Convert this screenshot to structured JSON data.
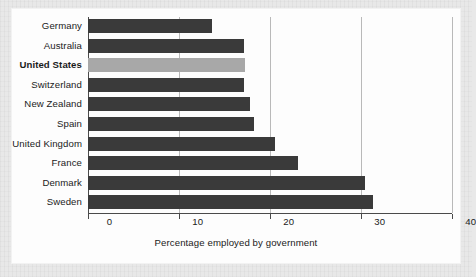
{
  "chart_data": {
    "type": "bar",
    "orientation": "horizontal",
    "title": "",
    "subtitle": "",
    "xlabel": "Percentage employed by government",
    "ylabel": "",
    "categories": [
      "Germany",
      "Australia",
      "United States",
      "Switzerland",
      "New Zealand",
      "Spain",
      "United Kingdom",
      "France",
      "Denmark",
      "Sweden"
    ],
    "values": [
      13.6,
      17.1,
      17.3,
      17.1,
      17.8,
      18.2,
      20.5,
      23.1,
      30.4,
      31.3
    ],
    "xlim": [
      0,
      40
    ],
    "xticks": [
      0,
      10,
      20,
      30,
      40
    ],
    "xtick_labels": [
      "0",
      "10",
      "20",
      "30",
      "40"
    ],
    "grid": "vertical",
    "legend": "none",
    "highlight_category": "United States",
    "colors": {
      "bar": "#3a3a3a",
      "bar_highlight": "#a8a8a8",
      "gridline": "#b9b9b9",
      "axis": "#4a4a4a",
      "text": "#1b1b1b",
      "plot_background": "#fdfdfd",
      "page_background": "#e8e8e8"
    }
  }
}
